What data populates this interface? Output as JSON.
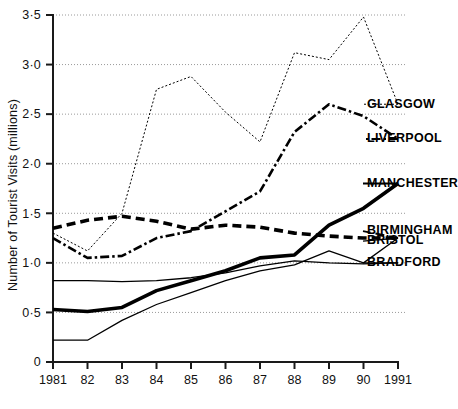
{
  "chart_data": {
    "type": "line",
    "title": "",
    "xlabel": "",
    "ylabel": "Number of Tourist Visits (millions)",
    "x": [
      1981,
      1982,
      1983,
      1984,
      1985,
      1986,
      1987,
      1988,
      1989,
      1990,
      1991
    ],
    "xtick_labels": [
      "1981",
      "82",
      "83",
      "84",
      "85",
      "86",
      "87",
      "88",
      "89",
      "90",
      "1991"
    ],
    "ytick_labels": [
      "0",
      "0·0",
      "0·5",
      "1·0",
      "1·5",
      "2·0",
      "2·5",
      "3·0",
      "3·5"
    ],
    "yticks": [
      0,
      0.5,
      1.0,
      1.5,
      2.0,
      2.5,
      3.0,
      3.5
    ],
    "ytick_text": [
      "0",
      "0·5",
      "1·0",
      "1·5",
      "2·0",
      "2·5",
      "3·0",
      "3·5"
    ],
    "ylim": [
      0,
      3.5
    ],
    "xlim": [
      1981,
      1991
    ],
    "grid": true,
    "grid_axis": "y",
    "legend_position": "right-inline-labels",
    "series": [
      {
        "name": "GLASGOW",
        "style": "dotted",
        "label_value": 2.6,
        "values": [
          1.3,
          1.12,
          1.5,
          2.75,
          2.88,
          2.52,
          2.22,
          3.12,
          3.05,
          3.48,
          2.6
        ]
      },
      {
        "name": "LIVERPOOL",
        "style": "dash-dot",
        "label_value": 2.25,
        "values": [
          1.25,
          1.05,
          1.07,
          1.25,
          1.32,
          1.52,
          1.72,
          2.32,
          2.6,
          2.48,
          2.25
        ]
      },
      {
        "name": "MANCHESTER",
        "style": "thick-solid",
        "label_value": 1.8,
        "values": [
          0.53,
          0.51,
          0.55,
          0.72,
          0.82,
          0.92,
          1.05,
          1.08,
          1.38,
          1.55,
          1.8
        ]
      },
      {
        "name": "BIRMINGHAM",
        "style": "thick-dashed",
        "label_value": 1.32,
        "values": [
          1.35,
          1.43,
          1.47,
          1.42,
          1.34,
          1.38,
          1.36,
          1.3,
          1.27,
          1.25,
          1.25
        ]
      },
      {
        "name": "BRISTOL",
        "style": "thin-solid",
        "label_value": 1.22,
        "values": [
          0.22,
          0.22,
          0.42,
          0.58,
          0.7,
          0.82,
          0.92,
          0.98,
          1.12,
          1.0,
          1.25
        ]
      },
      {
        "name": "BRADFORD",
        "style": "thin-solid",
        "label_value": 1.0,
        "values": [
          0.82,
          0.82,
          0.81,
          0.82,
          0.85,
          0.9,
          0.97,
          1.02,
          1.0,
          0.99,
          1.0
        ]
      }
    ]
  }
}
